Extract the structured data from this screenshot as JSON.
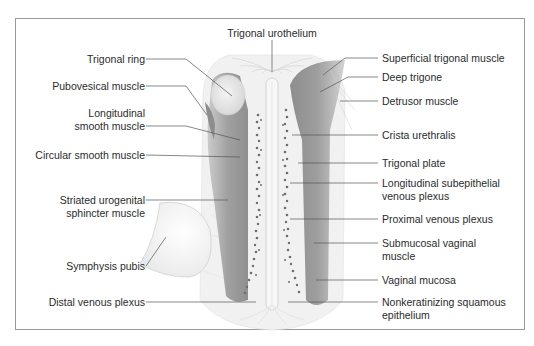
{
  "diagram": {
    "colors": {
      "muscle": "#9a9a9a",
      "muscle_dark": "#7d7d7d",
      "light_tissue": "#e6e6e6",
      "venous_plexus": "#6e6e6e",
      "leader_line": "#555555",
      "frame": "#9a9a9a"
    },
    "labels_top": {
      "trigonal_urothelium": "Trigonal urothelium"
    },
    "labels_left": {
      "trigonal_ring": "Trigonal ring",
      "pubovesical_muscle": "Pubovesical muscle",
      "longitudinal_smooth_muscle_1": "Longitudinal",
      "longitudinal_smooth_muscle_2": "smooth muscle",
      "circular_smooth_muscle": "Circular smooth muscle",
      "striated_urogenital_1": "Striated urogenital",
      "striated_urogenital_2": "sphincter muscle",
      "symphysis_pubis": "Symphysis pubis",
      "distal_venous_plexus": "Distal venous plexus"
    },
    "labels_right": {
      "superficial_trigonal_muscle": "Superficial trigonal muscle",
      "deep_trigone": "Deep trigone",
      "detrusor_muscle": "Detrusor muscle",
      "crista_urethralis": "Crista urethralis",
      "trigonal_plate": "Trigonal plate",
      "longitudinal_subepithelial_1": "Longitudinal subepithelial",
      "longitudinal_subepithelial_2": "venous plexus",
      "proximal_venous_plexus": "Proximal venous plexus",
      "submucosal_vaginal_1": "Submucosal vaginal",
      "submucosal_vaginal_2": "muscle",
      "vaginal_mucosa": "Vaginal mucosa",
      "nonkeratinizing_1": "Nonkeratinizing squamous",
      "nonkeratinizing_2": "epithelium"
    }
  }
}
